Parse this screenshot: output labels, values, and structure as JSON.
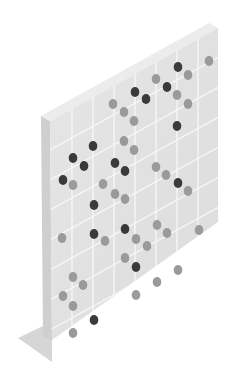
{
  "illustration": {
    "subject": "isometric pegboard with dark and light stones",
    "colors": {
      "background": "#ffffff",
      "face": "#dcdcdc",
      "face_top": "#e6e6e6",
      "side": "#cfcfcf",
      "side_shadow": "#c4c4c4",
      "top_edge": "#ececec",
      "base": "#d6d6d6",
      "grid_line": "#f7f7f7",
      "stone_dark": "#3a3a3a",
      "stone_light": "#9a9a9a"
    },
    "geometry": {
      "face": [
        [
          50,
          121
        ],
        [
          218,
          28
        ],
        [
          218,
          222
        ],
        [
          52,
          340
        ]
      ],
      "side": [
        [
          41,
          116
        ],
        [
          50,
          121
        ],
        [
          52,
          340
        ],
        [
          43,
          336
        ]
      ],
      "top_edge": [
        [
          41,
          116
        ],
        [
          209,
          23
        ],
        [
          218,
          28
        ],
        [
          50,
          121
        ]
      ],
      "base": [
        [
          18,
          338
        ],
        [
          43,
          326
        ],
        [
          52,
          340
        ],
        [
          52,
          362
        ]
      ],
      "vertical_lines_x": [
        72,
        93,
        114,
        135,
        156,
        177,
        198
      ],
      "diagonal_slope": -0.55,
      "diagonal_offsets_y": [
        150,
        180,
        210,
        240,
        270,
        300,
        330
      ]
    },
    "stones": [
      {
        "x": 178,
        "y": 67,
        "tone": "dark"
      },
      {
        "x": 188,
        "y": 75,
        "tone": "light"
      },
      {
        "x": 209,
        "y": 61,
        "tone": "light"
      },
      {
        "x": 156,
        "y": 79,
        "tone": "light"
      },
      {
        "x": 167,
        "y": 87,
        "tone": "dark"
      },
      {
        "x": 177,
        "y": 95,
        "tone": "light"
      },
      {
        "x": 188,
        "y": 104,
        "tone": "light"
      },
      {
        "x": 135,
        "y": 92,
        "tone": "dark"
      },
      {
        "x": 146,
        "y": 99,
        "tone": "dark"
      },
      {
        "x": 113,
        "y": 104,
        "tone": "light"
      },
      {
        "x": 124,
        "y": 112,
        "tone": "light"
      },
      {
        "x": 134,
        "y": 121,
        "tone": "light"
      },
      {
        "x": 177,
        "y": 126,
        "tone": "dark"
      },
      {
        "x": 124,
        "y": 141,
        "tone": "light"
      },
      {
        "x": 134,
        "y": 150,
        "tone": "light"
      },
      {
        "x": 93,
        "y": 146,
        "tone": "dark"
      },
      {
        "x": 73,
        "y": 158,
        "tone": "dark"
      },
      {
        "x": 84,
        "y": 166,
        "tone": "dark"
      },
      {
        "x": 115,
        "y": 163,
        "tone": "dark"
      },
      {
        "x": 125,
        "y": 171,
        "tone": "dark"
      },
      {
        "x": 156,
        "y": 167,
        "tone": "light"
      },
      {
        "x": 166,
        "y": 175,
        "tone": "light"
      },
      {
        "x": 178,
        "y": 183,
        "tone": "dark"
      },
      {
        "x": 188,
        "y": 191,
        "tone": "light"
      },
      {
        "x": 63,
        "y": 180,
        "tone": "dark"
      },
      {
        "x": 73,
        "y": 185,
        "tone": "light"
      },
      {
        "x": 103,
        "y": 184,
        "tone": "light"
      },
      {
        "x": 115,
        "y": 194,
        "tone": "light"
      },
      {
        "x": 125,
        "y": 199,
        "tone": "light"
      },
      {
        "x": 94,
        "y": 205,
        "tone": "dark"
      },
      {
        "x": 125,
        "y": 229,
        "tone": "dark"
      },
      {
        "x": 94,
        "y": 234,
        "tone": "dark"
      },
      {
        "x": 62,
        "y": 238,
        "tone": "light"
      },
      {
        "x": 105,
        "y": 241,
        "tone": "light"
      },
      {
        "x": 136,
        "y": 239,
        "tone": "light"
      },
      {
        "x": 147,
        "y": 246,
        "tone": "light"
      },
      {
        "x": 157,
        "y": 225,
        "tone": "light"
      },
      {
        "x": 167,
        "y": 233,
        "tone": "light"
      },
      {
        "x": 199,
        "y": 230,
        "tone": "light"
      },
      {
        "x": 125,
        "y": 258,
        "tone": "light"
      },
      {
        "x": 136,
        "y": 267,
        "tone": "dark"
      },
      {
        "x": 178,
        "y": 270,
        "tone": "light"
      },
      {
        "x": 157,
        "y": 282,
        "tone": "light"
      },
      {
        "x": 73,
        "y": 277,
        "tone": "light"
      },
      {
        "x": 83,
        "y": 285,
        "tone": "light"
      },
      {
        "x": 63,
        "y": 296,
        "tone": "light"
      },
      {
        "x": 73,
        "y": 306,
        "tone": "light"
      },
      {
        "x": 136,
        "y": 295,
        "tone": "light"
      },
      {
        "x": 94,
        "y": 320,
        "tone": "dark"
      },
      {
        "x": 73,
        "y": 333,
        "tone": "light"
      }
    ]
  }
}
